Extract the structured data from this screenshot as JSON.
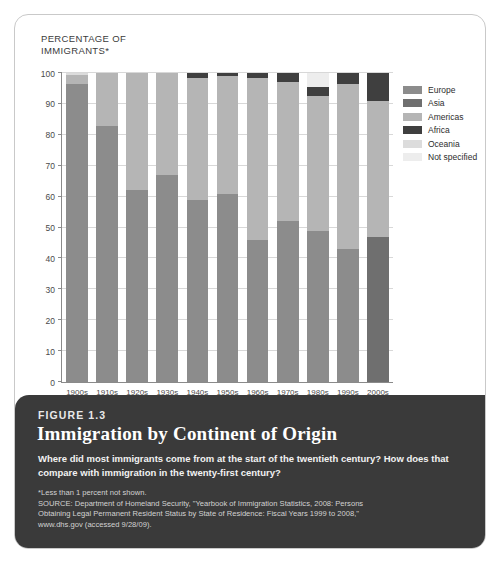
{
  "figure": {
    "number": "FIGURE 1.3",
    "title": "Immigration by Continent of Origin",
    "question": "Where did most immigrants come from at the start of the twentieth century? How does that compare with immigration in the twenty-first century?",
    "footnote": "*Less than 1 percent not shown.",
    "source_line1": "SOURCE: Department of Homeland Security, \"Yearbook of Immigration Statistics, 2008: Persons",
    "source_line2": "Obtaining Legal Permanent Resident Status by State of Residence: Fiscal Years 1999 to 2008,\"",
    "source_line3": "www.dhs.gov (accessed 9/28/09)."
  },
  "colors": {
    "card_background": "#ffffff",
    "card_border": "#c9c9c9",
    "caption_background": "#3a3a3a",
    "axis": "#8a8a8a",
    "gridline": "#d8d8d8",
    "europe": "#8c8c8c",
    "asia": "#6f6f6f",
    "americas": "#b5b5b5",
    "africa": "#3f3f3f",
    "oceania": "#dcdcdc",
    "not_specified": "#ededed"
  },
  "chart_data": {
    "type": "bar",
    "stacked": true,
    "title": "Immigration by Continent of Origin",
    "xlabel": "",
    "ylabel": "PERCENTAGE OF\nIMMIGRANTS*",
    "ylim": [
      0,
      100
    ],
    "yticks": [
      0,
      10,
      20,
      30,
      40,
      50,
      60,
      70,
      80,
      90,
      100
    ],
    "grid": true,
    "legend_position": "right",
    "categories": [
      "1900s",
      "1910s",
      "1920s",
      "1930s",
      "1940s",
      "1950s",
      "1960s",
      "1970s",
      "1980s",
      "1990s",
      "2000s"
    ],
    "series": [
      {
        "name": "Europe",
        "color": "#8c8c8c",
        "values": [
          96.5,
          83.0,
          62.0,
          67.0,
          59.0,
          61.0,
          46.0,
          52.0,
          49.0,
          43.0,
          0.0
        ]
      },
      {
        "name": "Asia",
        "color": "#6f6f6f",
        "values": [
          0.0,
          0.0,
          0.0,
          0.0,
          0.0,
          0.0,
          0.0,
          0.0,
          0.0,
          0.0,
          47.0
        ]
      },
      {
        "name": "Americas",
        "color": "#b5b5b5",
        "values": [
          3.0,
          17.0,
          38.0,
          33.0,
          39.5,
          38.0,
          52.5,
          45.0,
          43.5,
          53.5,
          44.0
        ]
      },
      {
        "name": "Africa",
        "color": "#3f3f3f",
        "values": [
          0.0,
          0.0,
          0.0,
          0.0,
          1.5,
          1.0,
          1.5,
          3.0,
          3.0,
          3.5,
          9.0
        ]
      },
      {
        "name": "Oceania",
        "color": "#dcdcdc",
        "values": [
          0.5,
          0.0,
          0.0,
          0.0,
          0.0,
          0.0,
          0.0,
          0.0,
          0.0,
          0.0,
          0.0
        ]
      },
      {
        "name": "Not specified",
        "color": "#ededed",
        "values": [
          0.0,
          0.0,
          0.0,
          0.0,
          0.0,
          0.0,
          0.0,
          0.0,
          4.5,
          0.0,
          0.0
        ]
      }
    ]
  }
}
